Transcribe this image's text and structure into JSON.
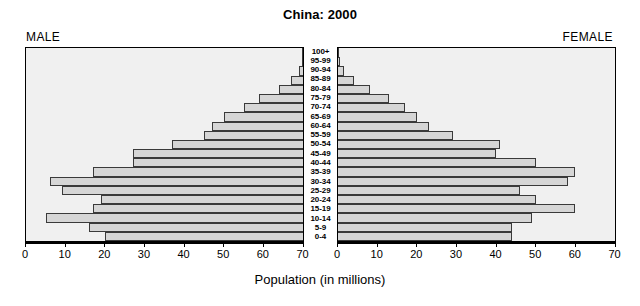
{
  "chart_data": {
    "type": "bar",
    "subtype": "population-pyramid",
    "title": "China: 2000",
    "xlabel": "Population (in millions)",
    "ylabel": "",
    "grid": false,
    "legend_position": "none",
    "left_panel_label": "MALE",
    "right_panel_label": "FEMALE",
    "xlim_left": [
      70,
      0
    ],
    "xlim_right": [
      0,
      70
    ],
    "xticks": [
      0,
      10,
      20,
      30,
      40,
      50,
      60,
      70
    ],
    "xticklabels_left": [
      "70",
      "60",
      "50",
      "40",
      "30",
      "20",
      "10",
      "0"
    ],
    "xticklabels_right": [
      "0",
      "10",
      "20",
      "30",
      "40",
      "50",
      "60",
      "70"
    ],
    "categories": [
      "100+",
      "95-99",
      "90-94",
      "85-89",
      "80-84",
      "75-79",
      "70-74",
      "65-69",
      "60-64",
      "55-59",
      "50-54",
      "45-49",
      "40-44",
      "35-39",
      "30-34",
      "25-29",
      "20-24",
      "15-19",
      "10-14",
      "5-9",
      "0-4"
    ],
    "series": [
      {
        "name": "MALE",
        "side": "left",
        "values": [
          0.05,
          0.3,
          1.0,
          3.0,
          6.0,
          11.0,
          15.0,
          20.0,
          23.0,
          25.0,
          33.0,
          43.0,
          43.0,
          53.0,
          64.0,
          61.0,
          51.0,
          53.0,
          65.0,
          54.0,
          50.0
        ]
      },
      {
        "name": "FEMALE",
        "side": "right",
        "values": [
          0.05,
          0.5,
          1.5,
          4.0,
          8.0,
          13.0,
          17.0,
          20.0,
          23.0,
          29.0,
          41.0,
          40.0,
          50.0,
          60.0,
          58.0,
          46.0,
          50.0,
          60.0,
          49.0,
          44.0,
          44.0
        ]
      }
    ],
    "axis_max": 70,
    "colors": {
      "bar_fill": "#d6d6d6",
      "bar_border": "#3a3a3a",
      "panel_background": "#f0f0f0",
      "panel_border": "#000000",
      "text": "#000000",
      "page_background": "#ffffff"
    }
  }
}
